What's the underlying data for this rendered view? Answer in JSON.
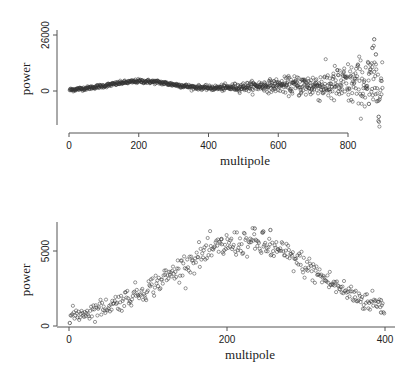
{
  "chart_data": [
    {
      "type": "scatter",
      "panel": "top",
      "title": "",
      "xlabel": "multipole",
      "ylabel": "power",
      "x_ticks": [
        0,
        200,
        400,
        600,
        800
      ],
      "y_ticks": [
        0,
        26000
      ],
      "xlim": [
        0,
        900
      ],
      "ylim": [
        -16000,
        32000
      ],
      "grid": false,
      "legend": null,
      "marker": "open-circle",
      "n_points": 899,
      "trend_points": {
        "x": [
          2,
          50,
          100,
          150,
          200,
          250,
          300,
          350,
          400,
          450,
          500,
          550,
          600,
          650,
          700,
          750,
          800,
          850,
          899
        ],
        "y": [
          500,
          1300,
          2400,
          3800,
          4600,
          4200,
          3000,
          1900,
          1400,
          1500,
          1900,
          2400,
          2600,
          2600,
          2500,
          2600,
          3000,
          3500,
          3000
        ]
      },
      "noise_sd": {
        "x": [
          0,
          400,
          600,
          700,
          800,
          899
        ],
        "sd": [
          400,
          500,
          1500,
          3000,
          5000,
          8000
        ]
      },
      "notable_points": [
        {
          "x": 875,
          "y": 24000
        },
        {
          "x": 870,
          "y": 20000
        },
        {
          "x": 880,
          "y": 17000
        },
        {
          "x": 888,
          "y": -12000
        },
        {
          "x": 860,
          "y": -6000
        }
      ]
    },
    {
      "type": "scatter",
      "panel": "bottom",
      "title": "",
      "xlabel": "multipole",
      "ylabel": "power",
      "x_ticks": [
        0,
        200,
        400
      ],
      "y_ticks": [
        0,
        5000
      ],
      "xlim": [
        0,
        405
      ],
      "ylim": [
        0,
        6800
      ],
      "grid": false,
      "legend": null,
      "marker": "open-circle",
      "n_points": 399,
      "trend_points": {
        "x": [
          2,
          25,
          50,
          75,
          100,
          125,
          150,
          175,
          200,
          225,
          250,
          275,
          300,
          325,
          350,
          375,
          399
        ],
        "y": [
          700,
          950,
          1350,
          1900,
          2500,
          3300,
          4200,
          4900,
          5400,
          5600,
          5300,
          4800,
          4000,
          3100,
          2300,
          1700,
          1400
        ]
      },
      "noise_sd": {
        "x": [
          0,
          200,
          399
        ],
        "sd": [
          250,
          450,
          350
        ]
      },
      "notable_points": [
        {
          "x": 1,
          "y": 200
        },
        {
          "x": 235,
          "y": 6500
        },
        {
          "x": 246,
          "y": 6300
        },
        {
          "x": 255,
          "y": 6400
        },
        {
          "x": 193,
          "y": 5800
        },
        {
          "x": 395,
          "y": 900
        }
      ]
    }
  ],
  "panels": [
    {
      "xlabel": "multipole",
      "ylabel": "power",
      "x_tick_labels": [
        "0",
        "200",
        "400",
        "600",
        "800"
      ],
      "y_tick_labels": [
        "0",
        "26000"
      ]
    },
    {
      "xlabel": "multipole",
      "ylabel": "power",
      "x_tick_labels": [
        "0",
        "200",
        "400"
      ],
      "y_tick_labels": [
        "0",
        "5000"
      ]
    }
  ],
  "colors": {
    "marker_stroke": "#333333",
    "axis": "#555555",
    "text": "#222222",
    "background": "#ffffff"
  }
}
